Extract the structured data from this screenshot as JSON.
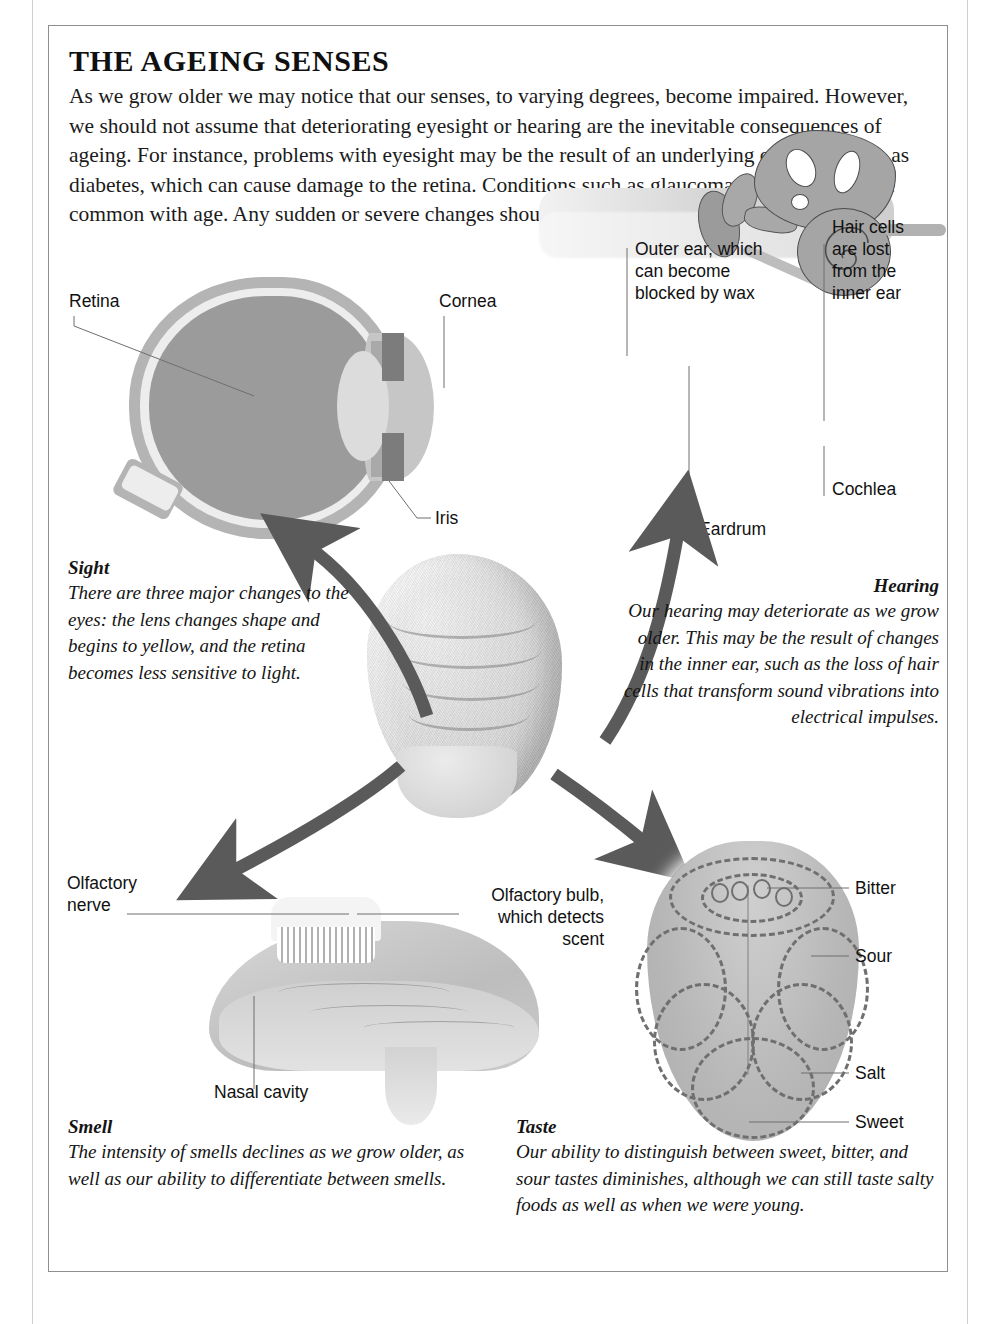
{
  "page": {
    "title": "THE AGEING SENSES",
    "intro": "As we grow older we may notice that our senses, to varying degrees, become impaired. However, we should not assume that deteriorating eyesight or hearing are the inevitable consequences of ageing. For instance, problems with eyesight may be the result of an underlying condition such as diabetes, which can cause damage to the retina. Conditions such as glaucoma also become more common with age. Any sudden or severe changes should be reported to your doctor.",
    "scan_artifact": ""
  },
  "eye": {
    "labels": {
      "retina": "Retina",
      "cornea": "Cornea",
      "iris": "Iris"
    }
  },
  "ear": {
    "labels": {
      "outer_ear": "Outer ear, which\ncan become\nblocked by wax",
      "hair_cells": "Hair cells\nare lost\nfrom the\ninner ear",
      "cochlea": "Cochlea",
      "eardrum": "Eardrum"
    }
  },
  "nose": {
    "labels": {
      "olfactory_nerve": "Olfactory\nnerve",
      "olfactory_bulb": "Olfactory bulb,\nwhich detects\nscent",
      "nasal_cavity": "Nasal cavity"
    }
  },
  "tongue": {
    "labels": {
      "bitter": "Bitter",
      "sour": "Sour",
      "salt": "Salt",
      "sweet": "Sweet"
    }
  },
  "senses": {
    "sight": {
      "heading": "Sight",
      "body": "There are three major changes to the eyes: the lens changes shape and begins to yellow, and the retina becomes less sensitive to light."
    },
    "hearing": {
      "heading": "Hearing",
      "body": "Our hearing may deteriorate as we grow older. This may be the result of changes in the inner ear, such as the loss of hair cells that transform sound vibrations into electrical impulses."
    },
    "smell": {
      "heading": "Smell",
      "body": "The intensity of smells declines as we grow older, as well as our ability to differentiate between smells."
    },
    "taste": {
      "heading": "Taste",
      "body": "Our ability to distinguish between sweet, bitter, and sour tastes diminishes, although we can still taste salty foods as well as when we were young."
    }
  },
  "colors": {
    "ink": "#1b1b1b",
    "rule": "#8e8e8e",
    "arrow": "#5a5a5a",
    "diagram_mid": "#b4b4b4",
    "diagram_dark": "#7c7c7c",
    "diagram_light": "#ededed",
    "leader": "#6f6f6f"
  }
}
